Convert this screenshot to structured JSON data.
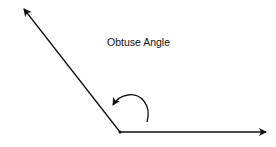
{
  "diagram": {
    "title": "Obtuse Angle",
    "vertex": [
      120,
      132
    ],
    "rays": [
      {
        "name": "upper-left-ray",
        "to": [
          23,
          8
        ]
      },
      {
        "name": "horizontal-ray",
        "to": [
          267,
          132
        ]
      }
    ],
    "colors": {
      "stroke": "#111111",
      "background": "#ffffff"
    }
  }
}
